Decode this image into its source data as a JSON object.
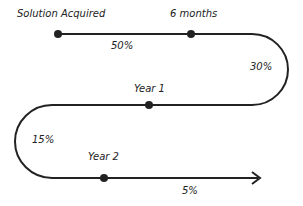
{
  "diagram": {
    "type": "timeline",
    "milestones": [
      {
        "label": "Solution Acquired"
      },
      {
        "label": "6 months"
      },
      {
        "label": "Year 1"
      },
      {
        "label": "Year 2"
      }
    ],
    "segments": [
      {
        "label": "50%"
      },
      {
        "label": "30%"
      },
      {
        "label": "15%"
      },
      {
        "label": "5%"
      }
    ],
    "colors": {
      "line": "#222222",
      "background": "#ffffff"
    }
  }
}
